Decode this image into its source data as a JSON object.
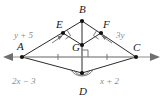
{
  "figure": {
    "background_color": "#ffffff",
    "line_color": "#2b2b2b",
    "axis_color": "#8f8f8f",
    "label_color": "#1a1a1a",
    "edge_label_color": "#8a8a8a",
    "vertices": [
      {
        "id": "A",
        "label": "A",
        "x": 22,
        "y": 57,
        "label_x": 17,
        "label_y": 50
      },
      {
        "id": "B",
        "label": "B",
        "x": 82,
        "y": 21,
        "label_x": 79,
        "label_y": 13
      },
      {
        "id": "C",
        "label": "C",
        "x": 136,
        "y": 57,
        "label_x": 133,
        "label_y": 51
      },
      {
        "id": "D",
        "label": "D",
        "x": 82,
        "y": 73,
        "label_x": 79,
        "label_y": 95
      },
      {
        "id": "E",
        "label": "E",
        "x": 63,
        "y": 33,
        "label_x": 56,
        "label_y": 28
      },
      {
        "id": "F",
        "label": "F",
        "x": 101,
        "y": 33,
        "label_x": 103,
        "label_y": 28
      },
      {
        "id": "G",
        "label": "G",
        "x": 82,
        "y": 45,
        "label_x": 72,
        "label_y": 51
      }
    ],
    "edge_labels": [
      {
        "id": "AB",
        "text": "y + 5",
        "x": 24,
        "y": 38
      },
      {
        "id": "BC",
        "text": "3y",
        "x": 116,
        "y": 38
      },
      {
        "id": "AD",
        "text": "2x − 3",
        "x": 22,
        "y": 83
      },
      {
        "id": "DC",
        "text": "x + 2",
        "x": 100,
        "y": 83
      }
    ],
    "axis": {
      "left_arrow_tip_x": 3,
      "right_arrow_tip_x": 160,
      "y": 57
    },
    "marks": {
      "right_angle_at_E": true,
      "right_angle_at_F": true,
      "right_angle_at_G": true,
      "congruence_ticks_on_AC": 2,
      "angle_arcs_at_D": 2,
      "angle_arrow_at_E": true,
      "angle_arrow_at_F": true
    }
  }
}
